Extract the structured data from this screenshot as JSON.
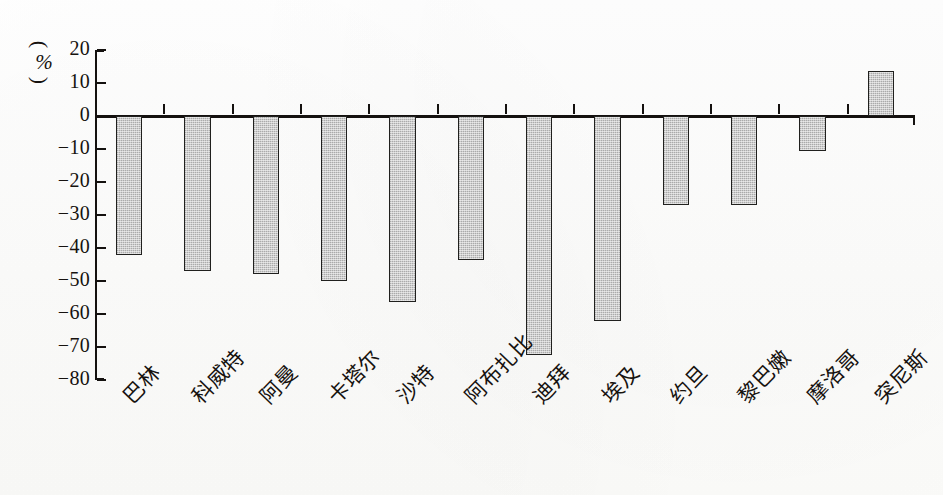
{
  "figure": {
    "background_color": "#fdfdfc",
    "ink_color": "#14110f",
    "bar_fill_color": "#cccccc",
    "bar_border_color": "#20201e"
  },
  "y_axis": {
    "unit_paren_open": "(",
    "unit_symbol": "%",
    "unit_paren_close": ")",
    "ticks": [
      "20",
      "10",
      "0",
      "-10",
      "-20",
      "-30",
      "-40",
      "-50",
      "-60",
      "-70",
      "-80"
    ]
  },
  "chart_data": {
    "type": "bar",
    "title": "",
    "xlabel": "",
    "ylabel": "(%)",
    "ylim": [
      -80,
      20
    ],
    "ytick_step": 10,
    "grid": false,
    "legend": "none",
    "orientation": "vertical",
    "baseline": 0,
    "categories": [
      "巴林",
      "科威特",
      "阿曼",
      "卡塔尔",
      "沙特",
      "阿布扎比",
      "迪拜",
      "埃及",
      "约旦",
      "黎巴嫩",
      "摩洛哥",
      "突尼斯"
    ],
    "categories_en": [
      "Bahrain",
      "Kuwait",
      "Oman",
      "Qatar",
      "Saudi Arabia",
      "Abu Dhabi",
      "Dubai",
      "Egypt",
      "Jordan",
      "Lebanon",
      "Morocco",
      "Tunisia"
    ],
    "values": [
      -42,
      -47,
      -48,
      -50,
      -56.5,
      -43.5,
      -72.5,
      -62,
      -27,
      -27,
      -10.5,
      13.5
    ]
  }
}
